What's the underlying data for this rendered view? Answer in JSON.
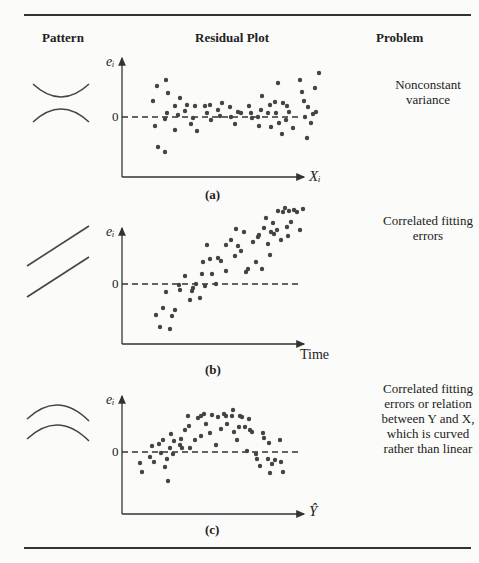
{
  "headers": {
    "pattern": "Pattern",
    "residual_plot": "Residual Plot",
    "problem": "Problem"
  },
  "panels": [
    {
      "caption": "(a)",
      "problem": "Nonconstant\nvariance",
      "xlabel": "Xᵢ",
      "ylabel": "eᵢ",
      "zero": "0"
    },
    {
      "caption": "(b)",
      "problem": "Correlated fitting\nerrors",
      "xlabel": "Time",
      "ylabel": "eᵢ",
      "zero": "0"
    },
    {
      "caption": "(c)",
      "problem": "Correlated fitting\nerrors or relation\nbetween Y and X,\nwhich is curved\nrather than linear",
      "xlabel": "Ŷ",
      "ylabel": "eᵢ",
      "zero": "0"
    }
  ],
  "chart_data": [
    {
      "type": "scatter",
      "title": "(a) Nonconstant variance",
      "xlabel": "X_i",
      "ylabel": "e_i",
      "points": [
        [
          153,
          101
        ],
        [
          155,
          126
        ],
        [
          157,
          86
        ],
        [
          158,
          147
        ],
        [
          166,
          80
        ],
        [
          165,
          119
        ],
        [
          165,
          152
        ],
        [
          167,
          113
        ],
        [
          168,
          93
        ],
        [
          175,
          106
        ],
        [
          175,
          130
        ],
        [
          178,
          115
        ],
        [
          180,
          98
        ],
        [
          185,
          111
        ],
        [
          187,
          105
        ],
        [
          191,
          124
        ],
        [
          193,
          118
        ],
        [
          195,
          106
        ],
        [
          197,
          131
        ],
        [
          205,
          106
        ],
        [
          207,
          113
        ],
        [
          210,
          105
        ],
        [
          211,
          120
        ],
        [
          218,
          110
        ],
        [
          220,
          116
        ],
        [
          222,
          103
        ],
        [
          230,
          107
        ],
        [
          231,
          117
        ],
        [
          235,
          124
        ],
        [
          238,
          112
        ],
        [
          241,
          113
        ],
        [
          249,
          106
        ],
        [
          251,
          113
        ],
        [
          252,
          118
        ],
        [
          258,
          117
        ],
        [
          259,
          126
        ],
        [
          261,
          110
        ],
        [
          262,
          96
        ],
        [
          268,
          113
        ],
        [
          270,
          105
        ],
        [
          271,
          127
        ],
        [
          275,
          102
        ],
        [
          276,
          113
        ],
        [
          278,
          83
        ],
        [
          279,
          123
        ],
        [
          282,
          134
        ],
        [
          283,
          103
        ],
        [
          286,
          120
        ],
        [
          287,
          106
        ],
        [
          289,
          112
        ],
        [
          293,
          128
        ],
        [
          300,
          80
        ],
        [
          302,
          92
        ],
        [
          304,
          101
        ],
        [
          305,
          117
        ],
        [
          307,
          138
        ],
        [
          308,
          107
        ],
        [
          311,
          123
        ],
        [
          313,
          114
        ],
        [
          315,
          88
        ],
        [
          316,
          112
        ],
        [
          319,
          73
        ]
      ]
    },
    {
      "type": "scatter",
      "title": "(b) Correlated fitting errors",
      "xlabel": "Time",
      "ylabel": "e_i",
      "points": [
        [
          156,
          315
        ],
        [
          160,
          327
        ],
        [
          163,
          308
        ],
        [
          166,
          292
        ],
        [
          170,
          329
        ],
        [
          172,
          316
        ],
        [
          175,
          310
        ],
        [
          179,
          285
        ],
        [
          180,
          290
        ],
        [
          185,
          276
        ],
        [
          190,
          300
        ],
        [
          192,
          291
        ],
        [
          193,
          288
        ],
        [
          196,
          284
        ],
        [
          200,
          298
        ],
        [
          202,
          274
        ],
        [
          203,
          262
        ],
        [
          205,
          286
        ],
        [
          207,
          245
        ],
        [
          210,
          259
        ],
        [
          212,
          274
        ],
        [
          216,
          284
        ],
        [
          218,
          258
        ],
        [
          221,
          261
        ],
        [
          226,
          271
        ],
        [
          226,
          245
        ],
        [
          231,
          240
        ],
        [
          235,
          256
        ],
        [
          236,
          229
        ],
        [
          238,
          246
        ],
        [
          241,
          251
        ],
        [
          244,
          232
        ],
        [
          246,
          272
        ],
        [
          248,
          269
        ],
        [
          253,
          242
        ],
        [
          256,
          262
        ],
        [
          258,
          237
        ],
        [
          259,
          235
        ],
        [
          262,
          269
        ],
        [
          264,
          228
        ],
        [
          266,
          218
        ],
        [
          268,
          244
        ],
        [
          270,
          255
        ],
        [
          271,
          232
        ],
        [
          273,
          223
        ],
        [
          274,
          234
        ],
        [
          277,
          230
        ],
        [
          278,
          211
        ],
        [
          281,
          240
        ],
        [
          283,
          212
        ],
        [
          285,
          208
        ],
        [
          287,
          227
        ],
        [
          288,
          236
        ],
        [
          289,
          211
        ],
        [
          291,
          222
        ],
        [
          294,
          210
        ],
        [
          297,
          212
        ],
        [
          300,
          230
        ],
        [
          303,
          209
        ]
      ]
    },
    {
      "type": "scatter",
      "title": "(c) Curved relation",
      "xlabel": "Ŷ",
      "ylabel": "e_i",
      "points": [
        [
          140,
          463
        ],
        [
          142,
          472
        ],
        [
          150,
          457
        ],
        [
          152,
          446
        ],
        [
          154,
          462
        ],
        [
          159,
          444
        ],
        [
          161,
          453
        ],
        [
          163,
          440
        ],
        [
          165,
          467
        ],
        [
          167,
          459
        ],
        [
          168,
          481
        ],
        [
          170,
          448
        ],
        [
          171,
          434
        ],
        [
          173,
          454
        ],
        [
          174,
          441
        ],
        [
          180,
          445
        ],
        [
          181,
          439
        ],
        [
          182,
          448
        ],
        [
          185,
          430
        ],
        [
          188,
          416
        ],
        [
          189,
          426
        ],
        [
          190,
          448
        ],
        [
          195,
          440
        ],
        [
          198,
          418
        ],
        [
          201,
          416
        ],
        [
          201,
          436
        ],
        [
          204,
          414
        ],
        [
          206,
          424
        ],
        [
          210,
          433
        ],
        [
          212,
          415
        ],
        [
          216,
          445
        ],
        [
          218,
          417
        ],
        [
          221,
          429
        ],
        [
          224,
          414
        ],
        [
          226,
          416
        ],
        [
          227,
          424
        ],
        [
          232,
          416
        ],
        [
          233,
          410
        ],
        [
          234,
          432
        ],
        [
          237,
          440
        ],
        [
          239,
          427
        ],
        [
          240,
          416
        ],
        [
          242,
          417
        ],
        [
          245,
          427
        ],
        [
          247,
          451
        ],
        [
          249,
          419
        ],
        [
          250,
          430
        ],
        [
          252,
          432
        ],
        [
          256,
          454
        ],
        [
          257,
          459
        ],
        [
          260,
          466
        ],
        [
          263,
          433
        ],
        [
          264,
          438
        ],
        [
          268,
          459
        ],
        [
          269,
          443
        ],
        [
          270,
          473
        ],
        [
          272,
          464
        ],
        [
          275,
          460
        ],
        [
          280,
          440
        ],
        [
          281,
          462
        ],
        [
          283,
          472
        ]
      ]
    }
  ]
}
